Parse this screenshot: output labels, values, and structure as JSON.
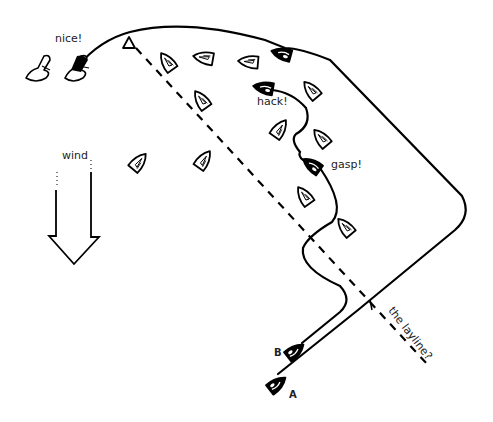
{
  "diagram": {
    "colors": {
      "background": "#ffffff",
      "ink": "#000000",
      "text": "#222222"
    },
    "labels": {
      "nice": "nice!",
      "hack": "hack!",
      "gasp": "gasp!",
      "wind": "wind",
      "layline": "the layline?",
      "boat_a": "A",
      "boat_b": "B"
    },
    "elements": {
      "mark": "triangle-mark",
      "wind_arrow": "down-arrow",
      "layline": "dashed-line",
      "boat_a_track": "outer-curved-track",
      "boat_b_track": "inner-zigzag-track"
    }
  }
}
